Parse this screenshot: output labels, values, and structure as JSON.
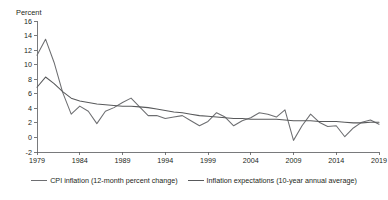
{
  "chart_data": {
    "type": "line",
    "title": "",
    "subtitle": "",
    "xlabel": "",
    "ylabel": "Percent",
    "ylim": [
      -2,
      16
    ],
    "xlim": [
      1979,
      2019
    ],
    "yticks": [
      -2,
      0,
      2,
      4,
      6,
      8,
      10,
      12,
      14,
      16
    ],
    "ytick_labels": [
      "-2",
      "0",
      "2",
      "4",
      "6",
      "8",
      "10",
      "12",
      "14",
      "16"
    ],
    "xticks": [
      1979,
      1984,
      1989,
      1994,
      1999,
      2004,
      2009,
      2014,
      2019
    ],
    "xtick_labels": [
      "1979",
      "1984",
      "1989",
      "1994",
      "1999",
      "2004",
      "2009",
      "2014",
      "2019"
    ],
    "grid": false,
    "legend_position": "bottom-center",
    "x": [
      1979,
      1980,
      1981,
      1982,
      1983,
      1984,
      1985,
      1986,
      1987,
      1988,
      1989,
      1990,
      1991,
      1992,
      1993,
      1994,
      1995,
      1996,
      1997,
      1998,
      1999,
      2000,
      2001,
      2002,
      2003,
      2004,
      2005,
      2006,
      2007,
      2008,
      2009,
      2010,
      2011,
      2012,
      2013,
      2014,
      2015,
      2016,
      2017,
      2018,
      2019
    ],
    "series": [
      {
        "name": "CPI inflation (12-month percent change)",
        "color": "#6d6e71",
        "values": [
          11.3,
          13.5,
          10.3,
          6.2,
          3.2,
          4.3,
          3.6,
          1.9,
          3.6,
          4.1,
          4.8,
          5.4,
          4.2,
          3.0,
          3.0,
          2.6,
          2.8,
          3.0,
          2.3,
          1.6,
          2.2,
          3.4,
          2.8,
          1.6,
          2.3,
          2.7,
          3.4,
          3.2,
          2.8,
          3.8,
          -0.4,
          1.6,
          3.2,
          2.1,
          1.5,
          1.6,
          0.1,
          1.3,
          2.1,
          2.4,
          1.8
        ]
      },
      {
        "name": "Inflation expectations (10-year annual average)",
        "color": "#58595b",
        "values": [
          6.9,
          8.3,
          7.4,
          6.3,
          5.4,
          5.0,
          4.8,
          4.6,
          4.5,
          4.4,
          4.3,
          4.3,
          4.2,
          4.1,
          3.9,
          3.7,
          3.5,
          3.4,
          3.2,
          3.0,
          2.9,
          2.8,
          2.7,
          2.6,
          2.6,
          2.5,
          2.5,
          2.5,
          2.5,
          2.4,
          2.3,
          2.3,
          2.3,
          2.2,
          2.2,
          2.2,
          2.1,
          2.0,
          2.0,
          2.1,
          2.1
        ]
      }
    ]
  },
  "axis": {
    "y_unit_label": "Percent"
  },
  "legend": {
    "items": [
      {
        "label": "CPI inflation (12-month percent change)",
        "color": "#6d6e71"
      },
      {
        "label": "Inflation expectations (10-year annual average)",
        "color": "#58595b"
      }
    ]
  }
}
